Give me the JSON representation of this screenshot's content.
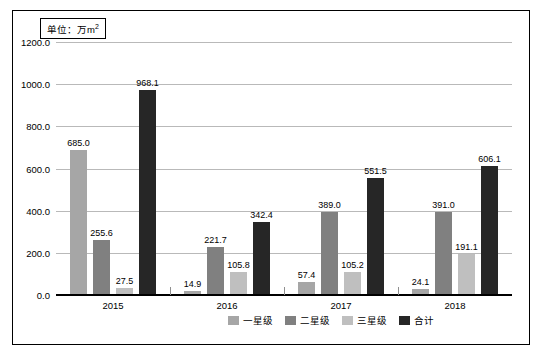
{
  "unit_label": "单位：万m",
  "unit_sup": "2",
  "legend_position": "bottom-center",
  "chart_data": {
    "type": "bar",
    "title": "",
    "xlabel": "",
    "ylabel": "",
    "unit": "万m²",
    "categories": [
      "2015",
      "2016",
      "2017",
      "2018"
    ],
    "series": [
      {
        "name": "一星级",
        "color": "#a6a6a6",
        "values": [
          685.0,
          14.9,
          57.4,
          24.1
        ]
      },
      {
        "name": "二星级",
        "color": "#808080",
        "values": [
          255.6,
          221.7,
          389.0,
          391.0
        ]
      },
      {
        "name": "三星级",
        "color": "#bfbfbf",
        "values": [
          27.5,
          105.8,
          105.2,
          191.1
        ]
      },
      {
        "name": "合计",
        "color": "#262626",
        "values": [
          968.1,
          342.4,
          551.5,
          606.1
        ]
      }
    ],
    "value_labels": {
      "2015": [
        "685.0",
        "255.6",
        "27.5",
        "968.1"
      ],
      "2016": [
        "14.9",
        "221.7",
        "105.8",
        "342.4"
      ],
      "2017": [
        "57.4",
        "389.0",
        "105.2",
        "551.5"
      ],
      "2018": [
        "24.1",
        "391.0",
        "191.1",
        "606.1"
      ]
    },
    "yticks": [
      "0.0",
      "200.0",
      "400.0",
      "600.0",
      "800.0",
      "1000.0",
      "1200.0"
    ],
    "ylim": [
      0,
      1200
    ],
    "grid": true,
    "legend": [
      "一星级",
      "二星级",
      "三星级",
      "合计"
    ]
  }
}
